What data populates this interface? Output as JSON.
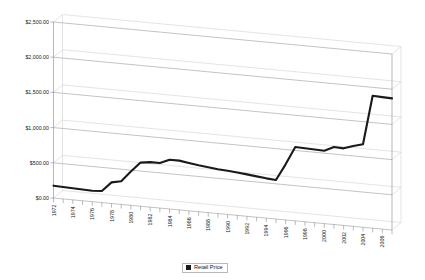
{
  "chart_data": {
    "type": "line",
    "title": "",
    "xlabel": "",
    "ylabel": "",
    "ylim": [
      0,
      2500
    ],
    "ytick_values": [
      0,
      500,
      1000,
      1500,
      2000,
      2500
    ],
    "ytick_labels": [
      "$0.00",
      "$500.00",
      "$1,000.00",
      "$1,500.00",
      "$2,000.00",
      "$2,500.00"
    ],
    "grid": true,
    "legend_position": "bottom",
    "series": [
      {
        "name": "Retail Price",
        "color": "#1a1a1a",
        "x": [
          1972,
          1973,
          1974,
          1975,
          1976,
          1977,
          1978,
          1979,
          1980,
          1981,
          1982,
          1983,
          1984,
          1985,
          1986,
          1987,
          1988,
          1989,
          1990,
          1991,
          1992,
          1993,
          1994,
          1995,
          1996,
          1997,
          1998,
          1999,
          2000,
          2001,
          2002,
          2003,
          2004,
          2005,
          2006,
          2007
        ],
        "values": [
          175,
          170,
          165,
          160,
          155,
          165,
          300,
          330,
          480,
          620,
          640,
          640,
          700,
          700,
          680,
          660,
          645,
          630,
          620,
          610,
          595,
          580,
          565,
          555,
          790,
          1050,
          1045,
          1040,
          1035,
          1100,
          1095,
          1140,
          1180,
          1880,
          1875,
          1870
        ]
      }
    ],
    "x_tick_years": [
      1972,
      1973,
      1974,
      1975,
      1976,
      1977,
      1978,
      1979,
      1980,
      1981,
      1982,
      1983,
      1984,
      1985,
      1986,
      1987,
      1988,
      1989,
      1990,
      1991,
      1992,
      1993,
      1994,
      1995,
      1996,
      1997,
      1998,
      1999,
      2000,
      2001,
      2002,
      2003,
      2004,
      2005,
      2006,
      2007
    ],
    "x_tick_labels": [
      "1972",
      "1974",
      "1976",
      "1978",
      "1980",
      "1982",
      "1984",
      "1986",
      "1988",
      "1990",
      "1992",
      "1994",
      "1996",
      "1998",
      "2000",
      "2002",
      "2004",
      "2006"
    ],
    "x_label_years": [
      1972,
      1974,
      1976,
      1978,
      1980,
      1982,
      1984,
      1986,
      1988,
      1990,
      1992,
      1994,
      1996,
      1998,
      2000,
      2002,
      2004,
      2006
    ]
  },
  "legend": {
    "entries": [
      {
        "label": "Retail Price",
        "color": "#1a1a1a"
      }
    ]
  },
  "axis": {
    "gridline_color": "#9a9a9a",
    "wall_color": "#c8c8c8",
    "tick_color": "#777777"
  }
}
